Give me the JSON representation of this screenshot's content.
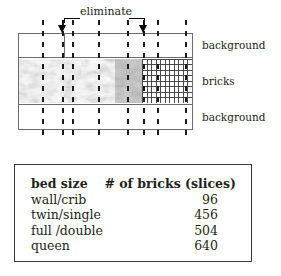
{
  "diagram": {
    "annotation_label": "eliminate",
    "band_labels": {
      "top": "background",
      "middle": "bricks",
      "bottom": "background"
    },
    "arrow_icon_name": "down-arrow-icon",
    "guide_line_positions": [
      42,
      72,
      98,
      127,
      157,
      185
    ],
    "arrow_positions": [
      62,
      143
    ]
  },
  "table": {
    "headers": [
      "bed size",
      "# of bricks (slices)"
    ],
    "rows": [
      {
        "size": "wall/crib",
        "bricks": "96"
      },
      {
        "size": "twin/single",
        "bricks": "456"
      },
      {
        "size": "full /double",
        "bricks": "504"
      },
      {
        "size": "queen",
        "bricks": "640"
      }
    ]
  },
  "colors": {
    "ink": "#231f20",
    "rule": "#6d6a68",
    "table_border": "#3a3735",
    "background": "#ffffff"
  }
}
